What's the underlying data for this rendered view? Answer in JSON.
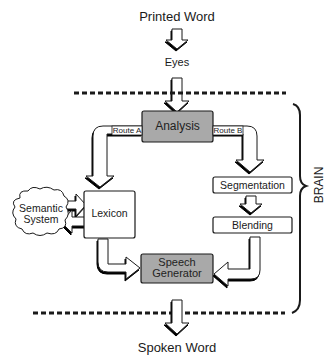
{
  "diagram": {
    "input_label": "Printed Word",
    "eyes_label": "Eyes",
    "output_label": "Spoken Word",
    "brain_label": "BRAIN",
    "nodes": {
      "analysis": "Analysis",
      "lexicon": "Lexicon",
      "semantic_system": [
        "Semantic",
        "System"
      ],
      "segmentation": "Segmentation",
      "blending": "Blending",
      "speech_generator": [
        "Speech",
        "Generator"
      ]
    },
    "routes": {
      "route_a": "Route A",
      "route_b": "Route B"
    },
    "colors": {
      "process_fill": "#a9a9a9",
      "box_fill": "#ffffff",
      "stroke": "#1a1a1a",
      "arrow_fill": "#ffffff"
    }
  }
}
